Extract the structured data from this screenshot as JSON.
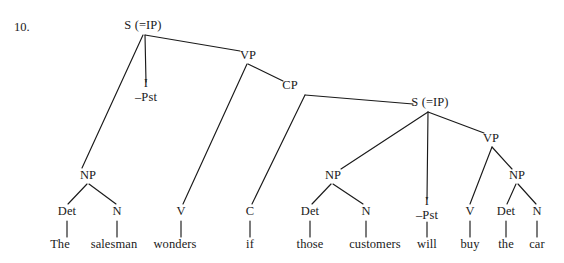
{
  "page": {
    "item_number": "10.",
    "width": 564,
    "height": 263,
    "background": "#ffffff",
    "ink_color": "#1a1a1a"
  },
  "sentence": "The salesman wonders if those customers will buy the car",
  "tree": {
    "nodes": [
      {
        "id": "s-matrix",
        "label": "S (=IP)",
        "x": 143,
        "y": 26,
        "kind": "category"
      },
      {
        "id": "i-matrix",
        "label": "I",
        "feature": "–Pst",
        "x": 146,
        "y": 90,
        "kind": "inflection"
      },
      {
        "id": "vp-matrix",
        "label": "VP",
        "x": 248,
        "y": 56,
        "kind": "category"
      },
      {
        "id": "cp",
        "label": "CP",
        "x": 290,
        "y": 86,
        "kind": "category"
      },
      {
        "id": "s-embedded",
        "label": "S (=IP)",
        "x": 430,
        "y": 103,
        "kind": "category"
      },
      {
        "id": "vp-embedded",
        "label": "VP",
        "x": 491,
        "y": 139,
        "kind": "category"
      },
      {
        "id": "np-subj",
        "label": "NP",
        "x": 88,
        "y": 176,
        "kind": "category"
      },
      {
        "id": "np-emb-subj",
        "label": "NP",
        "x": 333,
        "y": 176,
        "kind": "category"
      },
      {
        "id": "np-obj",
        "label": "NP",
        "x": 517,
        "y": 176,
        "kind": "category"
      },
      {
        "id": "det1",
        "label": "Det",
        "x": 67,
        "y": 212,
        "kind": "category"
      },
      {
        "id": "n1",
        "label": "N",
        "x": 117,
        "y": 212,
        "kind": "category"
      },
      {
        "id": "v1",
        "label": "V",
        "x": 181,
        "y": 212,
        "kind": "category"
      },
      {
        "id": "c1",
        "label": "C",
        "x": 250,
        "y": 212,
        "kind": "category"
      },
      {
        "id": "det2",
        "label": "Det",
        "x": 310,
        "y": 212,
        "kind": "category"
      },
      {
        "id": "n2",
        "label": "N",
        "x": 366,
        "y": 212,
        "kind": "category"
      },
      {
        "id": "i-embedded",
        "label": "I",
        "feature": "–Pst",
        "x": 427,
        "y": 208,
        "kind": "inflection"
      },
      {
        "id": "v2",
        "label": "V",
        "x": 470,
        "y": 212,
        "kind": "category"
      },
      {
        "id": "det3",
        "label": "Det",
        "x": 506,
        "y": 212,
        "kind": "category"
      },
      {
        "id": "n3",
        "label": "N",
        "x": 537,
        "y": 212,
        "kind": "category"
      }
    ],
    "words": [
      {
        "id": "w-the1",
        "label": "The",
        "x": 60,
        "y": 245
      },
      {
        "id": "w-salesman",
        "label": "salesman",
        "x": 114,
        "y": 245
      },
      {
        "id": "w-wonders",
        "label": "wonders",
        "x": 175,
        "y": 245
      },
      {
        "id": "w-if",
        "label": "if",
        "x": 250,
        "y": 245
      },
      {
        "id": "w-those",
        "label": "those",
        "x": 310,
        "y": 245
      },
      {
        "id": "w-customers",
        "label": "customers",
        "x": 375,
        "y": 245
      },
      {
        "id": "w-will",
        "label": "will",
        "x": 427,
        "y": 245
      },
      {
        "id": "w-buy",
        "label": "buy",
        "x": 470,
        "y": 245
      },
      {
        "id": "w-the2",
        "label": "the",
        "x": 506,
        "y": 245
      },
      {
        "id": "w-car",
        "label": "car",
        "x": 537,
        "y": 245
      }
    ],
    "edges": [
      {
        "from": "s-matrix",
        "to": "np-subj",
        "x1": 143,
        "y1": 35,
        "x2": 82,
        "y2": 168
      },
      {
        "from": "s-matrix",
        "to": "i-matrix",
        "x1": 145,
        "y1": 35,
        "x2": 146,
        "y2": 82
      },
      {
        "from": "s-matrix",
        "to": "vp-matrix",
        "x1": 145,
        "y1": 35,
        "x2": 240,
        "y2": 51
      },
      {
        "from": "vp-matrix",
        "to": "v1",
        "x1": 247,
        "y1": 64,
        "x2": 183,
        "y2": 204
      },
      {
        "from": "vp-matrix",
        "to": "cp",
        "x1": 248,
        "y1": 64,
        "x2": 283,
        "y2": 81
      },
      {
        "from": "cp",
        "to": "c1",
        "x1": 305,
        "y1": 95,
        "x2": 252,
        "y2": 204
      },
      {
        "from": "cp",
        "to": "s-embedded",
        "x1": 305,
        "y1": 95,
        "x2": 413,
        "y2": 104
      },
      {
        "from": "s-embedded",
        "to": "np-emb-subj",
        "x1": 428,
        "y1": 112,
        "x2": 341,
        "y2": 169
      },
      {
        "from": "s-embedded",
        "to": "i-embedded",
        "x1": 428,
        "y1": 112,
        "x2": 427,
        "y2": 199
      },
      {
        "from": "s-embedded",
        "to": "vp-embedded",
        "x1": 428,
        "y1": 112,
        "x2": 484,
        "y2": 133
      },
      {
        "from": "vp-embedded",
        "to": "v2",
        "x1": 492,
        "y1": 147,
        "x2": 470,
        "y2": 204
      },
      {
        "from": "vp-embedded",
        "to": "np-obj",
        "x1": 492,
        "y1": 147,
        "x2": 512,
        "y2": 169
      },
      {
        "from": "np-subj",
        "to": "det1",
        "x1": 87,
        "y1": 184,
        "x2": 68,
        "y2": 204
      },
      {
        "from": "np-subj",
        "to": "n1",
        "x1": 89,
        "y1": 184,
        "x2": 116,
        "y2": 204
      },
      {
        "from": "np-emb-subj",
        "to": "det2",
        "x1": 331,
        "y1": 184,
        "x2": 312,
        "y2": 204
      },
      {
        "from": "np-emb-subj",
        "to": "n2",
        "x1": 333,
        "y1": 184,
        "x2": 363,
        "y2": 204
      },
      {
        "from": "np-obj",
        "to": "det3",
        "x1": 516,
        "y1": 184,
        "x2": 507,
        "y2": 204
      },
      {
        "from": "np-obj",
        "to": "n3",
        "x1": 518,
        "y1": 184,
        "x2": 536,
        "y2": 204
      },
      {
        "from": "det1",
        "to": "w-the1",
        "x1": 67,
        "y1": 221,
        "x2": 67,
        "y2": 237
      },
      {
        "from": "n1",
        "to": "w-salesman",
        "x1": 117,
        "y1": 221,
        "x2": 117,
        "y2": 237
      },
      {
        "from": "v1",
        "to": "w-wonders",
        "x1": 181,
        "y1": 221,
        "x2": 181,
        "y2": 237
      },
      {
        "from": "c1",
        "to": "w-if",
        "x1": 250,
        "y1": 221,
        "x2": 250,
        "y2": 237
      },
      {
        "from": "det2",
        "to": "w-those",
        "x1": 310,
        "y1": 221,
        "x2": 310,
        "y2": 237
      },
      {
        "from": "n2",
        "to": "w-customers",
        "x1": 366,
        "y1": 221,
        "x2": 366,
        "y2": 237
      },
      {
        "from": "i-embedded",
        "to": "w-will",
        "x1": 427,
        "y1": 222,
        "x2": 427,
        "y2": 237
      },
      {
        "from": "v2",
        "to": "w-buy",
        "x1": 470,
        "y1": 221,
        "x2": 470,
        "y2": 237
      },
      {
        "from": "det3",
        "to": "w-the2",
        "x1": 506,
        "y1": 221,
        "x2": 506,
        "y2": 237
      },
      {
        "from": "n3",
        "to": "w-car",
        "x1": 537,
        "y1": 221,
        "x2": 537,
        "y2": 237
      }
    ]
  }
}
